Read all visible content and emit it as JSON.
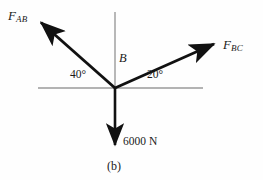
{
  "figure": {
    "caption": "(b)",
    "background_color": "#fefefe",
    "axis_color": "#9a9a9a",
    "vector_color": "#111111"
  },
  "point": {
    "label": "B",
    "x": 115,
    "y": 88
  },
  "axes": {
    "horizontal": {
      "x1": 38,
      "y1": 88,
      "x2": 203,
      "y2": 88
    },
    "vertical": {
      "x1": 115,
      "y1": 12,
      "x2": 115,
      "y2": 88
    }
  },
  "vectors": [
    {
      "name": "F_AB",
      "label_main": "F",
      "label_sub": "AB",
      "angle_label": "40°",
      "angle_degrees": 40,
      "direction": "up-left",
      "tail_x": 115,
      "tail_y": 88,
      "tip_x": 37,
      "tip_y": 19
    },
    {
      "name": "F_BC",
      "label_main": "F",
      "label_sub": "BC",
      "angle_label": "20°",
      "angle_degrees": 20,
      "direction": "up-right",
      "tail_x": 115,
      "tail_y": 88,
      "tip_x": 218,
      "tip_y": 42
    },
    {
      "name": "load",
      "label_main": "6000 N",
      "label_sub": "",
      "angle_label": "",
      "angle_degrees": 270,
      "direction": "down",
      "tail_x": 115,
      "tail_y": 88,
      "tip_x": 115,
      "tip_y": 149
    }
  ]
}
